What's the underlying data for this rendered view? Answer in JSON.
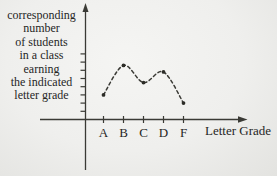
{
  "page": {
    "background": "#efefed",
    "ink_color": "#3a3a35",
    "text_color": "#26261f"
  },
  "y_axis_label": {
    "lines": [
      "corresponding",
      "number",
      "of students",
      "in a class",
      "earning",
      "the indicated",
      "letter grade"
    ]
  },
  "x_axis_label": "Letter Grade",
  "chart_data": {
    "type": "line",
    "line_style": "dashed",
    "marker": "dot",
    "categories": [
      "A",
      "B",
      "C",
      "D",
      "F"
    ],
    "values": [
      3,
      6.6,
      4.5,
      5.8,
      2
    ],
    "values_note": "y-axis ticks are unlabeled; values estimated in tick units from gridline ticks",
    "title": "",
    "xlabel": "Letter Grade",
    "ylabel": "corresponding number of students in a class earning the indicated letter grade",
    "ylim": [
      0,
      8
    ],
    "y_tick_count": 8,
    "x_tick_labels": [
      "A",
      "B",
      "C",
      "D",
      "F"
    ],
    "grid": false,
    "legend": "none"
  }
}
